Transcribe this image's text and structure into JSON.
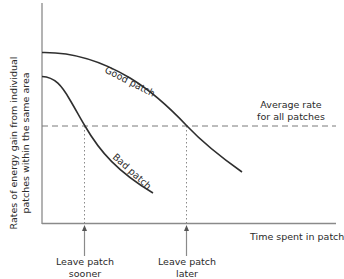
{
  "diagram": {
    "y_axis_label_line1": "Rates of energy gain from individual",
    "y_axis_label_line2": "patches within the same area",
    "x_axis_label": "Time spent in patch",
    "curves": {
      "good": {
        "label": "Good patch"
      },
      "bad": {
        "label": "Bad patch"
      }
    },
    "average_line": {
      "label_line1": "Average rate",
      "label_line2": "for all patches"
    },
    "markers": [
      {
        "label_line1": "Leave patch",
        "label_line2": "sooner"
      },
      {
        "label_line1": "Leave patch",
        "label_line2": "later"
      }
    ],
    "colors": {
      "line": "#2f2f2f",
      "axis": "#8a8a8a",
      "dashed": "#7a7a7a",
      "text": "#2a2a2a"
    }
  }
}
